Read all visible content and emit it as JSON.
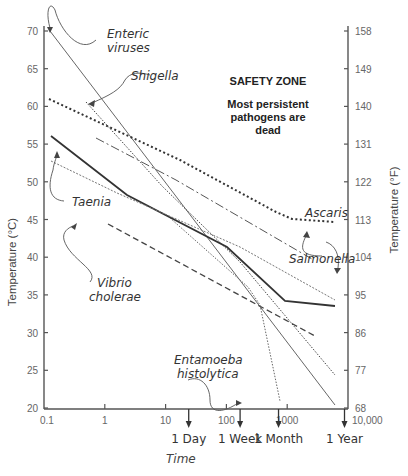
{
  "chart_data": {
    "type": "line",
    "title": "",
    "xlabel": "Time",
    "ylabel": "Temperature (°C)",
    "ylabel_right": "Temperature (°F)",
    "x_scale": "log",
    "xlim": [
      0.1,
      10000
    ],
    "ylim": [
      20,
      72
    ],
    "x_ticks": [
      "0.1",
      "1",
      "10",
      "100",
      "1000",
      "10,000"
    ],
    "y_ticks_left": [
      "20",
      "25",
      "30",
      "35",
      "40",
      "45",
      "50",
      "55",
      "60",
      "65",
      "70"
    ],
    "y_ticks_right": [
      "68",
      "77",
      "86",
      "95",
      "104",
      "113",
      "122",
      "131",
      "140",
      "149",
      "158"
    ],
    "time_markers": [
      {
        "label": "1 Day",
        "x": 24
      },
      {
        "label": "1 Week",
        "x": 168
      },
      {
        "label": "1 Month",
        "x": 720
      },
      {
        "label": "1 Year",
        "x": 8760
      }
    ],
    "grid": false,
    "annotation_zone": {
      "title": "SAFETY ZONE",
      "body": [
        "Most persistent",
        "pathogens are",
        "dead"
      ]
    },
    "series": [
      {
        "name": "Enteric viruses",
        "style": "thin-solid",
        "points": [
          [
            0.12,
            70
          ],
          [
            6000,
            24.5
          ]
        ]
      },
      {
        "name": "Shigella",
        "style": "dotted",
        "points": [
          [
            0.47,
            60.5
          ],
          [
            100,
            40
          ],
          [
            6000,
            28.5
          ]
        ]
      },
      {
        "name": "Ascaris",
        "style": "heavy-dotted",
        "points": [
          [
            0.12,
            61
          ],
          [
            200,
            45.5
          ],
          [
            700,
            42
          ],
          [
            6000,
            41.2
          ]
        ]
      },
      {
        "name": "Salmonella",
        "style": "dash-dot",
        "points": [
          [
            0.7,
            56
          ],
          [
            200,
            44
          ],
          [
            3000,
            40
          ]
        ]
      },
      {
        "name": "Taenia",
        "style": "thick-solid",
        "points": [
          [
            0.12,
            56
          ],
          [
            3,
            48
          ],
          [
            70,
            40
          ],
          [
            700,
            34
          ],
          [
            6000,
            33.5
          ]
        ]
      },
      {
        "name": "Taenia (alt)",
        "style": "grey-dotted",
        "points": [
          [
            0.12,
            53
          ],
          [
            1.5,
            49
          ],
          [
            40,
            42
          ],
          [
            6000,
            32
          ]
        ]
      },
      {
        "name": "Vibrio cholerae",
        "style": "dashed",
        "points": [
          [
            1,
            44.5
          ],
          [
            3000,
            30
          ]
        ]
      },
      {
        "name": "Entamoeba histolytica",
        "style": "dotted",
        "points": [
          [
            20,
            49
          ],
          [
            300,
            38
          ],
          [
            700,
            20.5
          ]
        ]
      }
    ]
  },
  "labels": {
    "enteric": [
      "Enteric",
      "viruses"
    ],
    "shigella": "Shigella",
    "ascaris": "Ascaris",
    "salmonella": "Salmonella",
    "taenia": "Taenia",
    "vibrio": [
      "Vibrio",
      "cholerae"
    ],
    "entamoeba": [
      "Entamoeba",
      "histolytica"
    ]
  }
}
